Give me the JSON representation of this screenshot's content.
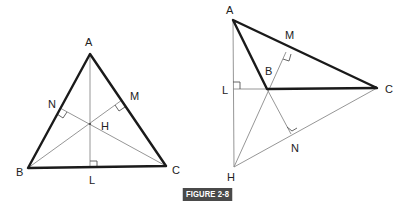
{
  "caption": "FIGURE 2-8",
  "figures": [
    {
      "name": "acute-triangle",
      "labels": {
        "A": "A",
        "B": "B",
        "C": "C",
        "H": "H",
        "L": "L",
        "M": "M",
        "N": "N"
      }
    },
    {
      "name": "obtuse-triangle",
      "labels": {
        "A": "A",
        "B": "B",
        "C": "C",
        "H": "H",
        "L": "L",
        "M": "M",
        "N": "N"
      }
    }
  ]
}
